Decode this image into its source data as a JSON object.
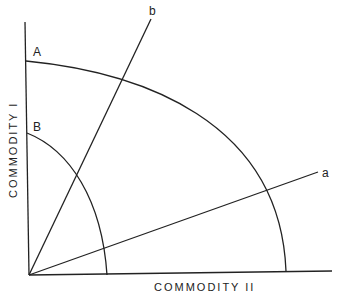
{
  "diagram": {
    "x_axis_label": "COMMODITY II",
    "y_axis_label": "COMMODITY I",
    "curves": [
      {
        "label": "A",
        "description": "outer production possibility frontier"
      },
      {
        "label": "B",
        "description": "inner production possibility frontier"
      }
    ],
    "rays": [
      {
        "label": "a",
        "description": "ray from origin with shallow slope"
      },
      {
        "label": "b",
        "description": "ray from origin with steep slope"
      }
    ],
    "colors": {
      "line": "#222222",
      "background": "#ffffff"
    }
  }
}
